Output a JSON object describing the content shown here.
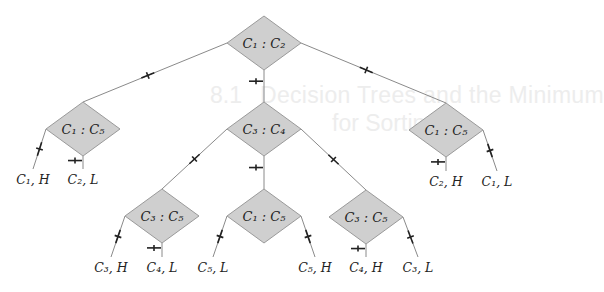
{
  "background_bleed": {
    "section_number": "8.1",
    "heading_line1": "Decision Trees and the Minimum",
    "heading_line2": "for Sorting"
  },
  "tree": {
    "node_fill": "#cfcfcf",
    "nodes": [
      {
        "id": "root",
        "label": "C₁ : C₂",
        "level": 0
      },
      {
        "id": "left",
        "label": "C₁ : C₅",
        "level": 1,
        "parent": "root"
      },
      {
        "id": "mid",
        "label": "C₃ : C₄",
        "level": 1,
        "parent": "root"
      },
      {
        "id": "right",
        "label": "C₁ : C₅",
        "level": 1,
        "parent": "root"
      },
      {
        "id": "mid-left",
        "label": "C₃ : C₅",
        "level": 2,
        "parent": "mid"
      },
      {
        "id": "mid-mid",
        "label": "C₁ : C₅",
        "level": 2,
        "parent": "mid"
      },
      {
        "id": "mid-right",
        "label": "C₃ : C₅",
        "level": 2,
        "parent": "mid"
      }
    ],
    "leaves": [
      {
        "id": "leaf-1",
        "label": "C₁, H",
        "parent": "left"
      },
      {
        "id": "leaf-2",
        "label": "C₂, L",
        "parent": "left"
      },
      {
        "id": "leaf-3",
        "label": "C₃, H",
        "parent": "mid-left"
      },
      {
        "id": "leaf-4",
        "label": "C₄, L",
        "parent": "mid-left"
      },
      {
        "id": "leaf-5",
        "label": "C₅, L",
        "parent": "mid-mid"
      },
      {
        "id": "leaf-6",
        "label": "C₅, H",
        "parent": "mid-mid"
      },
      {
        "id": "leaf-7",
        "label": "C₄, H",
        "parent": "mid-right"
      },
      {
        "id": "leaf-8",
        "label": "C₃, L",
        "parent": "mid-right"
      },
      {
        "id": "leaf-9",
        "label": "C₂, H",
        "parent": "right"
      },
      {
        "id": "leaf-10",
        "label": "C₁, L",
        "parent": "right"
      }
    ],
    "edge_markers": {
      "left_branch": "heavy-left",
      "middle_branch": "balanced",
      "right_branch": "heavy-right"
    }
  }
}
